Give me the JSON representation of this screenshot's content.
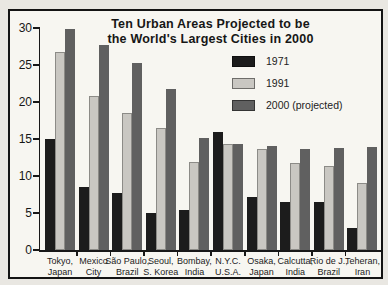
{
  "title": {
    "line1": "Ten Urban Areas Projected to be",
    "line2": "the World's Largest Cities in 2000"
  },
  "chart_data": {
    "type": "bar",
    "title": "Ten Urban Areas Projected to be the World's Largest Cities in 2000",
    "categories": [
      [
        "Tokyo,",
        "Japan"
      ],
      [
        "Mexico",
        "City"
      ],
      [
        "São Paulo,",
        "Brazil"
      ],
      [
        "Seoul,",
        "S. Korea"
      ],
      [
        "Bombay,",
        "India"
      ],
      [
        "N.Y.C.",
        "U.S.A."
      ],
      [
        "Osaka,",
        "Japan"
      ],
      [
        "Calcutta,",
        "India"
      ],
      [
        "Rio de J.,",
        "Brazil"
      ],
      [
        "Teheran,",
        "Iran"
      ]
    ],
    "series": [
      {
        "name": "1971",
        "color": "#1c1c1c",
        "values": [
          15.0,
          8.5,
          7.7,
          5.0,
          5.4,
          16.0,
          7.1,
          6.5,
          6.5,
          3.0
        ]
      },
      {
        "name": "1991",
        "color": "#c9c7c2",
        "values": [
          26.7,
          20.8,
          18.5,
          16.5,
          11.9,
          14.3,
          13.6,
          11.7,
          11.3,
          9.1
        ]
      },
      {
        "name": "2000 (projected)",
        "color": "#606060",
        "values": [
          29.8,
          27.7,
          25.3,
          21.8,
          15.1,
          14.3,
          14.0,
          13.6,
          13.8,
          13.9
        ]
      }
    ],
    "xlabel": "",
    "ylabel": "",
    "ylim": [
      0,
      30
    ],
    "yticks": [
      0,
      5,
      10,
      15,
      20,
      25,
      30
    ],
    "grid": false,
    "legend_position": "upper-right"
  }
}
